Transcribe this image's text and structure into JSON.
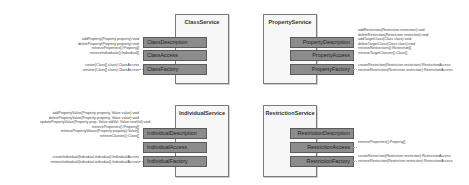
{
  "services": {
    "class": {
      "title": "ClassService",
      "components": [
        "ClassDescription",
        "ClassAccess",
        "ClassFactory"
      ],
      "description_ops": [
        "addProperty(Property property):void",
        "deleteProperty(Property property):void",
        "retrieveProperties():Property[]",
        "retrieveIndividuals():Individual[]"
      ],
      "factory_ops": [
        "create(Class[] class):ClassAccess",
        "retrieve(Class[] class):ClassAccess"
      ]
    },
    "property": {
      "title": "PropertyService",
      "components": [
        "PropertyDescription",
        "PropertyAccess",
        "PropertyFactory"
      ],
      "description_ops": [
        "addRestriction(Restriction restriction):void",
        "deleteRestriction(Restriction restriction):void",
        "addTargetClass(Class class):void",
        "deleteTargetClass(Class class):void",
        "retrieveRestrictions():Restriction[]",
        "retrieveTargetClasses():Class[]"
      ],
      "factory_ops": [
        "createRestriction(Restriction restriction):RestrictionAccess",
        "retrieveRestriction(Restriction restriction):RestrictionAccess"
      ]
    },
    "individual": {
      "title": "IndividualService",
      "components": [
        "IndividualDescription",
        "IndividualAccess",
        "IndividualFactory"
      ],
      "description_ops": [
        "addPropertyValue(Property property, Value value):void",
        "deletePropertyValue(Property property, Value value):void",
        "updatePropertyValue(Property prop, Value oldVal, Value newVal):void",
        "retrieveProperties():Property[]",
        "retrievePropertyValues(Property property):Value[]",
        "retrieveClasses():Class[]"
      ],
      "factory_ops": [
        "createIndividual(Individual individual):IndividualAccess",
        "retrieveIndividual(Individual individual):IndividualAccess"
      ]
    },
    "restriction": {
      "title": "RestrictionService",
      "components": [
        "RestrictionDescription",
        "RestrictionAccess",
        "RestrictionFactory"
      ],
      "access_ops": [
        "retrieveProperties():Property[]"
      ],
      "factory_ops": [
        "createRestriction(Restriction restriction):RestrictionAccess",
        "retrieveRestriction(Restriction restriction):RestrictionAccess"
      ]
    }
  }
}
